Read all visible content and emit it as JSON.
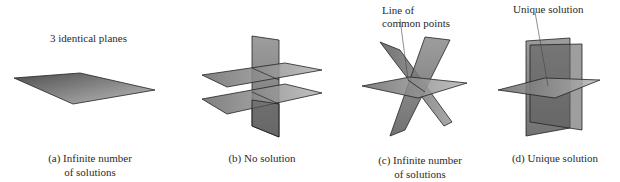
{
  "panels": [
    {
      "id": "a",
      "annotation": "3 identical planes",
      "caption_line1": "(a) Infinite number",
      "caption_line2": "of solutions"
    },
    {
      "id": "b",
      "caption_line1": "(b) No solution"
    },
    {
      "id": "c",
      "annotation_line1": "Line of",
      "annotation_line2": "common points",
      "caption_line1": "(c) Infinite number",
      "caption_line2": "of solutions"
    },
    {
      "id": "d",
      "annotation": "Unique solution",
      "caption_line1": "(d) Unique solution"
    }
  ],
  "colors": {
    "plane_dark": "#5a5a5a",
    "plane_light": "#b8b8b8",
    "edge": "#1e1e1e",
    "text": "#2a2a2a"
  }
}
